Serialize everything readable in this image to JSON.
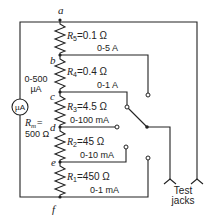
{
  "diagram": {
    "nodes": [
      "a",
      "b",
      "c",
      "d",
      "e",
      "f"
    ],
    "meter": {
      "symbol": "µA",
      "range_line1": "0-500",
      "range_line2": "µA",
      "rm_label": "R",
      "rm_sub": "m",
      "rm_eq": "=",
      "rm_value": "500 Ω"
    },
    "resistors": [
      {
        "name": "R",
        "sub": "5",
        "value": "=0.1 Ω",
        "range": "0-5 A"
      },
      {
        "name": "R",
        "sub": "4",
        "value": "=0.4 Ω",
        "range": "0-1 A"
      },
      {
        "name": "R",
        "sub": "3",
        "value": "=4.5 Ω",
        "range": "0-100 mA"
      },
      {
        "name": "R",
        "sub": "2",
        "value": "=45 Ω",
        "range": "0-10 mA"
      },
      {
        "name": "R",
        "sub": "1",
        "value": "=450 Ω",
        "range": "0-1 mA"
      }
    ],
    "jacks_label_line1": "Test",
    "jacks_label_line2": "jacks"
  }
}
